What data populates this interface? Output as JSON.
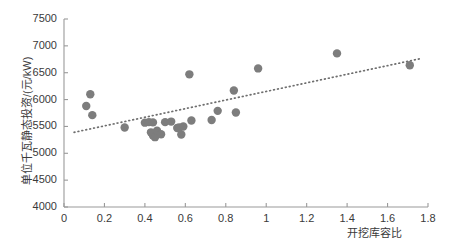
{
  "chart_data": {
    "type": "scatter",
    "title": "",
    "xlabel": "开挖库容比",
    "ylabel": "单位千瓦静态投资/(元/kW)",
    "xlim": [
      0,
      1.8
    ],
    "ylim": [
      4000,
      7500
    ],
    "xticks": [
      0,
      0.2,
      0.4,
      0.6,
      0.8,
      1,
      1.2,
      1.4,
      1.6,
      1.8
    ],
    "xticklabels": [
      "0",
      "0.2",
      "0.4",
      "0.6",
      "0.8",
      "1",
      "1.2",
      "1.4",
      "1.6",
      "1.8"
    ],
    "yticks": [
      4000,
      4500,
      5000,
      5500,
      6000,
      6500,
      7000,
      7500
    ],
    "yticklabels": [
      "4000",
      "4500",
      "5000",
      "5500",
      "6000",
      "6500",
      "7000",
      "7500"
    ],
    "grid": false,
    "legend": null,
    "marker_color": "#7d7d7d",
    "marker_size": 6.2,
    "axis_color": "#9a9a9a",
    "trendline": {
      "style": "dotted",
      "color": "#6e6e6e",
      "x_start": 0.05,
      "y_start": 5390,
      "x_end": 1.76,
      "y_end": 6760
    },
    "points": [
      {
        "x": 0.11,
        "y": 5880
      },
      {
        "x": 0.13,
        "y": 6100
      },
      {
        "x": 0.14,
        "y": 5710
      },
      {
        "x": 0.3,
        "y": 5480
      },
      {
        "x": 0.4,
        "y": 5570
      },
      {
        "x": 0.42,
        "y": 5580
      },
      {
        "x": 0.44,
        "y": 5575
      },
      {
        "x": 0.43,
        "y": 5390
      },
      {
        "x": 0.44,
        "y": 5330
      },
      {
        "x": 0.45,
        "y": 5300
      },
      {
        "x": 0.46,
        "y": 5420
      },
      {
        "x": 0.48,
        "y": 5355
      },
      {
        "x": 0.5,
        "y": 5580
      },
      {
        "x": 0.53,
        "y": 5590
      },
      {
        "x": 0.56,
        "y": 5470
      },
      {
        "x": 0.57,
        "y": 5480
      },
      {
        "x": 0.59,
        "y": 5500
      },
      {
        "x": 0.58,
        "y": 5350
      },
      {
        "x": 0.63,
        "y": 5610
      },
      {
        "x": 0.62,
        "y": 6470
      },
      {
        "x": 0.73,
        "y": 5620
      },
      {
        "x": 0.76,
        "y": 5790
      },
      {
        "x": 0.85,
        "y": 5760
      },
      {
        "x": 0.84,
        "y": 6170
      },
      {
        "x": 0.96,
        "y": 6580
      },
      {
        "x": 1.35,
        "y": 6860
      },
      {
        "x": 1.71,
        "y": 6640
      }
    ]
  }
}
